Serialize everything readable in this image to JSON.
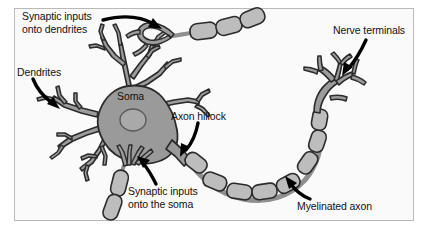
{
  "figure": {
    "background_color": "#fafafa",
    "frame_color": "#b9b9b9",
    "page_color": "#ffffff",
    "width": 429,
    "height": 231
  },
  "palette": {
    "soma_fill": "#9a9a9a",
    "nucleus_fill": "#a9a9a9",
    "dendrite_fill": "#9c9c9c",
    "myelin_fill": "#bdbdbd",
    "axon_fill": "#a6a6a6",
    "outline": "#2b2b2b",
    "arrow": "#000000",
    "text": "#111111"
  },
  "labels": {
    "synaptic_inputs_dendrites": "Synaptic inputs\nonto dendrites",
    "dendrites": "Dendrites",
    "soma": "Soma",
    "axon_hillock": "Axon hillock",
    "nerve_terminals": "Nerve terminals",
    "synaptic_inputs_soma": "Synaptic inputs\nonto the soma",
    "myelinated_axon": "Myelinated axon"
  },
  "parts": {
    "soma": "cell body",
    "nucleus": "nucleus",
    "dendritic_tree": "branching dendrites",
    "axon_hillock": "axon hillock",
    "myelinated_axon": "myelinated axon with myelin segments",
    "nerve_terminals": "branching nerve terminals",
    "presynaptic_axon_top": "incoming myelinated axon onto dendrite",
    "presynaptic_axon_bottom": "incoming myelinated axon onto soma"
  },
  "arrows": [
    {
      "name": "arrow-to-synaptic-dendrites",
      "from_label": "synaptic_inputs_dendrites"
    },
    {
      "name": "arrow-to-dendrites",
      "from_label": "dendrites"
    },
    {
      "name": "arrow-to-axon-hillock",
      "from_label": "axon_hillock"
    },
    {
      "name": "arrow-to-nerve-terminals",
      "from_label": "nerve_terminals"
    },
    {
      "name": "arrow-to-synaptic-soma",
      "from_label": "synaptic_inputs_soma"
    },
    {
      "name": "arrow-to-myelinated-axon",
      "from_label": "myelinated_axon"
    }
  ]
}
